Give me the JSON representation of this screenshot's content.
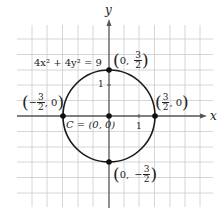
{
  "diagram": {
    "equation": "4x² + 4y² = 9",
    "axis_labels": {
      "x": "x",
      "y": "y"
    },
    "tick_labels": {
      "x_one": "1",
      "y_one": "1"
    },
    "center_label": "C = (0, 0)",
    "points": {
      "top": {
        "prefix": "0,",
        "sign": "",
        "num": "3",
        "den": "2"
      },
      "bottom": {
        "prefix": "0,",
        "sign": "−",
        "num": "3",
        "den": "2"
      },
      "left": {
        "sign": "−",
        "num": "3",
        "den": "2",
        "suffix": ", 0"
      },
      "right": {
        "sign": "",
        "num": "3",
        "den": "2",
        "suffix": ", 0"
      }
    },
    "colors": {
      "grid": "#c8c8c8",
      "axis": "#555555",
      "curve": "#1a1a1a"
    }
  }
}
